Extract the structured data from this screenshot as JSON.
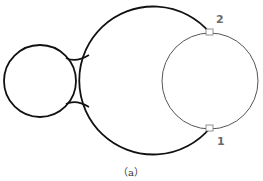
{
  "diagram": {
    "caption": "（a）",
    "points": [
      {
        "label": "2",
        "x": 210,
        "y": 33
      },
      {
        "label": "1",
        "x": 210,
        "y": 128
      }
    ],
    "shapes": {
      "small_circle": {
        "cx": 40,
        "cy": 81,
        "r": 36
      },
      "large_arc": {
        "cx": 157,
        "cy": 80,
        "r": 74
      },
      "right_circle": {
        "cx": 210,
        "cy": 81,
        "r": 48
      }
    },
    "colors": {
      "thick_stroke": "#111111",
      "thin_stroke": "#555555",
      "label": "#6b6b6b"
    }
  }
}
